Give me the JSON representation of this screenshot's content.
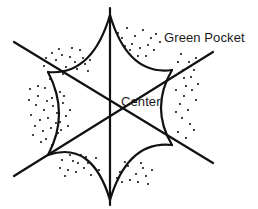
{
  "diagram": {
    "type": "line-diagram",
    "width": 258,
    "height": 209,
    "background_color": "#ffffff",
    "stroke_color": "#111111",
    "text_color": "#1a1a1a",
    "labels": {
      "green_pocket": "Green Pocket",
      "center": "Center"
    },
    "geometry": {
      "center": {
        "x": 110,
        "y": 108
      },
      "tips": [
        {
          "name": "top",
          "x": 110,
          "y": 15
        },
        {
          "name": "upper-right",
          "x": 172,
          "y": 70
        },
        {
          "name": "lower-right",
          "x": 172,
          "y": 145
        },
        {
          "name": "bottom",
          "x": 110,
          "y": 200
        },
        {
          "name": "lower-left",
          "x": 48,
          "y": 155
        },
        {
          "name": "upper-left",
          "x": 48,
          "y": 72
        }
      ],
      "axes": [
        {
          "name": "vertical-axis",
          "x1": 110,
          "y1": 8,
          "x2": 110,
          "y2": 205
        },
        {
          "name": "diagonal-axis-nw-se",
          "x1": 14,
          "y1": 42,
          "x2": 213,
          "y2": 163
        },
        {
          "name": "diagonal-axis-sw-ne",
          "x1": 14,
          "y1": 176,
          "x2": 213,
          "y2": 52
        }
      ],
      "arc_style": "concave-inward",
      "stipple": "dots-in-outer-pockets"
    },
    "stipple_dots": [
      [
        44,
        66
      ],
      [
        56,
        60
      ],
      [
        63,
        74
      ],
      [
        70,
        57
      ],
      [
        77,
        69
      ],
      [
        83,
        58
      ],
      [
        59,
        49
      ],
      [
        72,
        48
      ],
      [
        88,
        71
      ],
      [
        50,
        79
      ],
      [
        66,
        67
      ],
      [
        80,
        50
      ],
      [
        90,
        60
      ],
      [
        52,
        53
      ],
      [
        46,
        58
      ],
      [
        62,
        55
      ],
      [
        75,
        62
      ],
      [
        85,
        64
      ],
      [
        30,
        89
      ],
      [
        38,
        96
      ],
      [
        45,
        88
      ],
      [
        52,
        98
      ],
      [
        60,
        92
      ],
      [
        36,
        105
      ],
      [
        44,
        110
      ],
      [
        53,
        106
      ],
      [
        31,
        115
      ],
      [
        40,
        120
      ],
      [
        48,
        118
      ],
      [
        57,
        113
      ],
      [
        35,
        126
      ],
      [
        43,
        131
      ],
      [
        51,
        128
      ],
      [
        60,
        122
      ],
      [
        29,
        100
      ],
      [
        47,
        101
      ],
      [
        55,
        90
      ],
      [
        63,
        103
      ],
      [
        38,
        86
      ],
      [
        66,
        116
      ],
      [
        58,
        133
      ],
      [
        46,
        139
      ],
      [
        33,
        135
      ],
      [
        41,
        142
      ],
      [
        52,
        145
      ],
      [
        61,
        130
      ],
      [
        68,
        126
      ],
      [
        70,
        110
      ],
      [
        64,
        96
      ],
      [
        56,
        123
      ],
      [
        62,
        160
      ],
      [
        70,
        155
      ],
      [
        78,
        163
      ],
      [
        86,
        157
      ],
      [
        93,
        166
      ],
      [
        68,
        170
      ],
      [
        76,
        172
      ],
      [
        84,
        168
      ],
      [
        91,
        175
      ],
      [
        60,
        168
      ],
      [
        73,
        161
      ],
      [
        81,
        155
      ],
      [
        88,
        163
      ],
      [
        96,
        158
      ],
      [
        99,
        170
      ],
      [
        65,
        176
      ],
      [
        120,
        172
      ],
      [
        128,
        166
      ],
      [
        136,
        174
      ],
      [
        143,
        168
      ],
      [
        130,
        180
      ],
      [
        122,
        182
      ],
      [
        138,
        182
      ],
      [
        146,
        176
      ],
      [
        125,
        162
      ],
      [
        133,
        158
      ],
      [
        141,
        163
      ],
      [
        148,
        184
      ],
      [
        117,
        178
      ],
      [
        152,
        170
      ],
      [
        127,
        28
      ],
      [
        135,
        36
      ],
      [
        143,
        30
      ],
      [
        151,
        38
      ],
      [
        132,
        44
      ],
      [
        140,
        48
      ],
      [
        148,
        45
      ],
      [
        156,
        34
      ],
      [
        122,
        38
      ],
      [
        130,
        50
      ],
      [
        138,
        56
      ],
      [
        146,
        56
      ],
      [
        154,
        50
      ],
      [
        160,
        42
      ],
      [
        125,
        46
      ],
      [
        118,
        33
      ],
      [
        181,
        54
      ],
      [
        189,
        62
      ],
      [
        183,
        70
      ],
      [
        191,
        77
      ],
      [
        186,
        86
      ],
      [
        194,
        70
      ],
      [
        178,
        62
      ],
      [
        196,
        58
      ],
      [
        184,
        96
      ],
      [
        192,
        90
      ],
      [
        180,
        104
      ],
      [
        188,
        110
      ],
      [
        196,
        100
      ],
      [
        182,
        118
      ],
      [
        190,
        124
      ],
      [
        178,
        132
      ],
      [
        186,
        138
      ],
      [
        194,
        130
      ],
      [
        176,
        112
      ],
      [
        184,
        78
      ],
      [
        198,
        84
      ],
      [
        176,
        90
      ]
    ]
  }
}
